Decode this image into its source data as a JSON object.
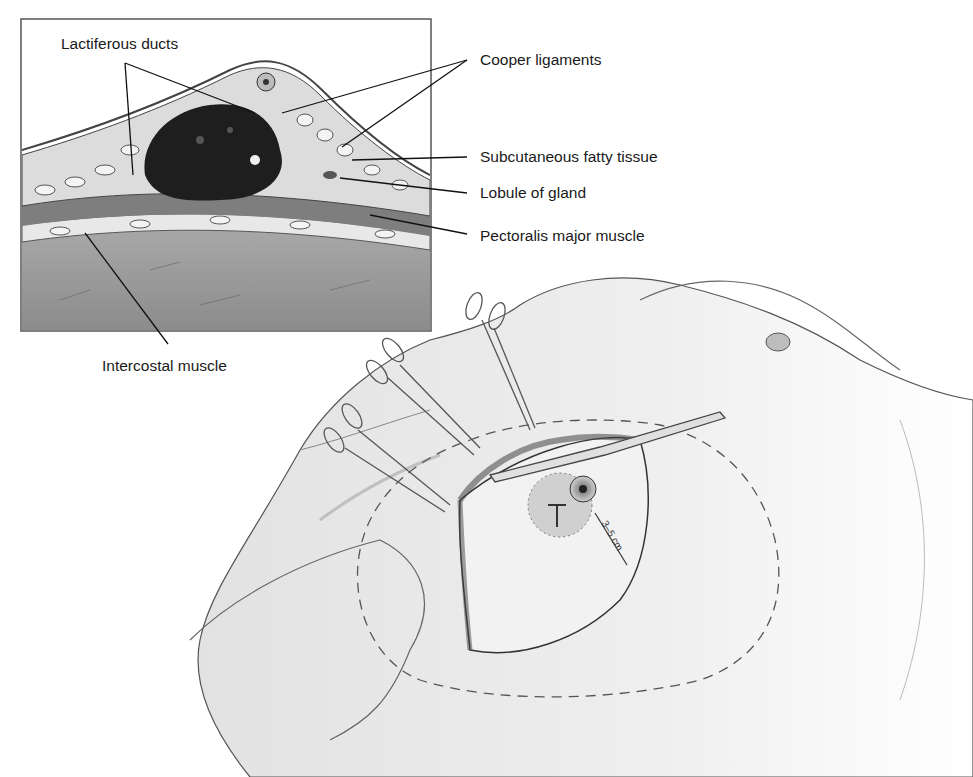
{
  "figure": {
    "type": "anatomical-surgical-illustration",
    "inset": {
      "labels": {
        "lactiferous_ducts": "Lactiferous ducts",
        "cooper_ligaments": "Cooper ligaments",
        "subcutaneous_fatty_tissue": "Subcutaneous fatty tissue",
        "lobule_of_gland": "Lobule of gland",
        "pectoralis_major_muscle": "Pectoralis major muscle",
        "intercostal_muscle": "Intercostal muscle"
      }
    },
    "main": {
      "measurement_label": "3–5 cm",
      "instruments": [
        "hemostat-clamp",
        "hemostat-clamp",
        "hemostat-clamp",
        "hemostat-clamp",
        "scalpel"
      ]
    },
    "colors": {
      "background": "#ffffff",
      "line": "#1a1a1a",
      "inset_muscle": "#9a9a9a",
      "tumor": "#1e1e1e",
      "skin_shade": "#e6e6e6"
    }
  }
}
